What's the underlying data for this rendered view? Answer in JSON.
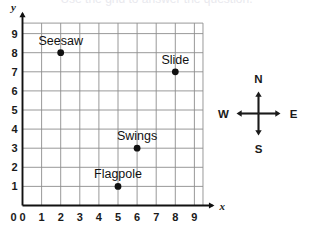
{
  "figure": {
    "cropped_top_text": "Use the grid to answer the question.",
    "background_color": "#ffffff",
    "grid_color": "#8d8d8d",
    "axis_color": "#111111",
    "point_color": "#111111"
  },
  "chart_data": {
    "type": "scatter",
    "title": "",
    "xlabel": "x",
    "ylabel": "y",
    "xlim": [
      0,
      9.6
    ],
    "ylim": [
      0,
      9.8
    ],
    "xticks": [
      "0",
      "1",
      "2",
      "3",
      "4",
      "5",
      "6",
      "7",
      "8",
      "9"
    ],
    "yticks": [
      "0",
      "1",
      "2",
      "3",
      "4",
      "5",
      "6",
      "7",
      "8",
      "9"
    ],
    "grid": true,
    "legend": "none",
    "points": [
      {
        "label": "Seesaw",
        "x": 2,
        "y": 8
      },
      {
        "label": "Slide",
        "x": 8,
        "y": 7
      },
      {
        "label": "Swings",
        "x": 6,
        "y": 3
      },
      {
        "label": "Flagpole",
        "x": 5,
        "y": 1
      }
    ]
  },
  "compass": {
    "north": "N",
    "east": "E",
    "south": "S",
    "west": "W"
  }
}
